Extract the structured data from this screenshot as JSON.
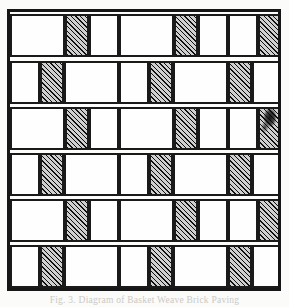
{
  "figure": {
    "caption": "Fig. 3. Diagram of Basket Weave Brick Paving",
    "frame_color": "#161616",
    "tile_outline_color": "#1a1a1a",
    "blank_tile_color": "#fefefe",
    "hatch_line_color": "#101010",
    "hatch_background_color": "#cfcfcf",
    "background_color": "#fbfbf9",
    "rows": 6,
    "row_offset_types": [
      "A",
      "B",
      "A",
      "B",
      "A",
      "B"
    ],
    "pattern_description": "Basket-weave brick paving diagram: alternating wide blank bricks and narrow diagonally hatched bricks in six offset courses"
  },
  "chart_data": {
    "type": "table",
    "xlabel": "",
    "ylabel": "",
    "legend": [
      {
        "label": "blank brick",
        "fill": "blank"
      },
      {
        "label": "hatched brick",
        "fill": "hatch"
      }
    ],
    "frame": {
      "x": 7,
      "y": 9,
      "width": 274,
      "height": 282
    },
    "row_tops": [
      0,
      47,
      93,
      139,
      185,
      231
    ],
    "row_height": 47,
    "rows": [
      {
        "index": 0,
        "tiles": [
          {
            "x": 0,
            "w": 55,
            "fill": "blank"
          },
          {
            "x": 55,
            "w": 24,
            "fill": "hatch"
          },
          {
            "x": 79,
            "w": 30,
            "fill": "blank"
          },
          {
            "x": 109,
            "w": 55,
            "fill": "blank"
          },
          {
            "x": 164,
            "w": 24,
            "fill": "hatch"
          },
          {
            "x": 188,
            "w": 30,
            "fill": "blank"
          },
          {
            "x": 218,
            "w": 30,
            "fill": "blank"
          },
          {
            "x": 248,
            "w": 24,
            "fill": "hatch"
          }
        ]
      },
      {
        "index": 1,
        "tiles": [
          {
            "x": 0,
            "w": 30,
            "fill": "blank"
          },
          {
            "x": 30,
            "w": 24,
            "fill": "hatch"
          },
          {
            "x": 54,
            "w": 55,
            "fill": "blank"
          },
          {
            "x": 109,
            "w": 30,
            "fill": "blank"
          },
          {
            "x": 139,
            "w": 24,
            "fill": "hatch"
          },
          {
            "x": 163,
            "w": 55,
            "fill": "blank"
          },
          {
            "x": 218,
            "w": 24,
            "fill": "hatch"
          },
          {
            "x": 242,
            "w": 30,
            "fill": "blank"
          }
        ]
      },
      {
        "index": 2,
        "tiles": [
          {
            "x": 0,
            "w": 55,
            "fill": "blank"
          },
          {
            "x": 55,
            "w": 24,
            "fill": "hatch"
          },
          {
            "x": 79,
            "w": 30,
            "fill": "blank"
          },
          {
            "x": 109,
            "w": 55,
            "fill": "blank"
          },
          {
            "x": 164,
            "w": 24,
            "fill": "hatch"
          },
          {
            "x": 188,
            "w": 30,
            "fill": "blank"
          },
          {
            "x": 218,
            "w": 30,
            "fill": "blank"
          },
          {
            "x": 248,
            "w": 24,
            "fill": "hatch",
            "smudge": true
          }
        ]
      },
      {
        "index": 3,
        "tiles": [
          {
            "x": 0,
            "w": 30,
            "fill": "blank"
          },
          {
            "x": 30,
            "w": 24,
            "fill": "hatch"
          },
          {
            "x": 54,
            "w": 55,
            "fill": "blank"
          },
          {
            "x": 109,
            "w": 30,
            "fill": "blank"
          },
          {
            "x": 139,
            "w": 24,
            "fill": "hatch"
          },
          {
            "x": 163,
            "w": 55,
            "fill": "blank"
          },
          {
            "x": 218,
            "w": 24,
            "fill": "hatch"
          },
          {
            "x": 242,
            "w": 30,
            "fill": "blank"
          }
        ]
      },
      {
        "index": 4,
        "tiles": [
          {
            "x": 0,
            "w": 55,
            "fill": "blank"
          },
          {
            "x": 55,
            "w": 24,
            "fill": "hatch"
          },
          {
            "x": 79,
            "w": 30,
            "fill": "blank"
          },
          {
            "x": 109,
            "w": 55,
            "fill": "blank"
          },
          {
            "x": 164,
            "w": 24,
            "fill": "hatch"
          },
          {
            "x": 188,
            "w": 30,
            "fill": "blank"
          },
          {
            "x": 218,
            "w": 30,
            "fill": "blank"
          },
          {
            "x": 248,
            "w": 24,
            "fill": "hatch"
          }
        ]
      },
      {
        "index": 5,
        "tiles": [
          {
            "x": 0,
            "w": 30,
            "fill": "blank"
          },
          {
            "x": 30,
            "w": 24,
            "fill": "hatch"
          },
          {
            "x": 54,
            "w": 55,
            "fill": "blank"
          },
          {
            "x": 109,
            "w": 30,
            "fill": "blank"
          },
          {
            "x": 139,
            "w": 24,
            "fill": "hatch"
          },
          {
            "x": 163,
            "w": 55,
            "fill": "blank"
          },
          {
            "x": 218,
            "w": 24,
            "fill": "hatch"
          },
          {
            "x": 242,
            "w": 30,
            "fill": "blank"
          }
        ]
      }
    ]
  }
}
